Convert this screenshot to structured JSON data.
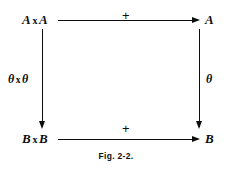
{
  "figure": {
    "caption": "Fig. 2-2.",
    "ink_color": "#0d0d0d",
    "background_color": "#ffffff",
    "nodes": {
      "top_left": {
        "base": "A",
        "operator": "x",
        "second": "A",
        "full": "A x A"
      },
      "top_right": {
        "base": "A",
        "full": "A"
      },
      "bottom_left": {
        "base": "B",
        "operator": "x",
        "second": "B",
        "full": "B x B"
      },
      "bottom_right": {
        "base": "B",
        "full": "B"
      }
    },
    "edges": {
      "top": {
        "label": "+",
        "direction": "right"
      },
      "bottom": {
        "label": "+",
        "direction": "right"
      },
      "left": {
        "label_first": "θ",
        "label_operator": "x",
        "label_second": "θ",
        "label_full": "θ x θ",
        "direction": "down"
      },
      "right": {
        "label": "θ",
        "direction": "down"
      }
    }
  }
}
